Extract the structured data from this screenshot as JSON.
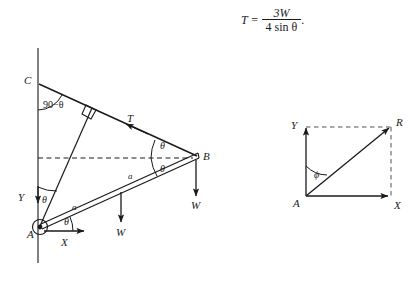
{
  "figure": {
    "equation": {
      "lhs": "T =",
      "numerator": "3W",
      "denominator": "4 sin θ",
      "trailing": "."
    },
    "left_diagram": {
      "name": "beam-free-body-diagram",
      "points": [
        {
          "id": "A",
          "label": "A",
          "x": 40,
          "y": 227
        },
        {
          "id": "B",
          "label": "B",
          "x": 196,
          "y": 157
        },
        {
          "id": "C",
          "label": "C",
          "x": 38,
          "y": 83
        }
      ],
      "axes": [
        {
          "id": "Y",
          "label": "Y",
          "direction": "down"
        },
        {
          "id": "X",
          "label": "X",
          "direction": "right"
        }
      ],
      "angle_labels": [
        {
          "id": "angle-c",
          "label": "90−θ"
        },
        {
          "id": "angle-a-vertical",
          "label": "θ"
        },
        {
          "id": "angle-a-horizontal",
          "label": "θ"
        },
        {
          "id": "angle-b-upper",
          "label": "θ"
        },
        {
          "id": "angle-b-lower",
          "label": "θ"
        }
      ],
      "force_labels": [
        {
          "id": "tension",
          "label": "T"
        },
        {
          "id": "weight-mid",
          "label": "W"
        },
        {
          "id": "weight-end",
          "label": "W"
        }
      ],
      "length_labels": [
        {
          "id": "segment-a-lower",
          "label": "a"
        },
        {
          "id": "segment-a-upper",
          "label": "a"
        }
      ]
    },
    "right_diagram": {
      "name": "resultant-vector-diagram",
      "points": [
        {
          "id": "A",
          "label": "A"
        },
        {
          "id": "R",
          "label": "R"
        }
      ],
      "axes": [
        {
          "id": "Y",
          "label": "Y",
          "direction": "up"
        },
        {
          "id": "X",
          "label": "X",
          "direction": "right"
        }
      ],
      "angle_labels": [
        {
          "id": "angle-phi",
          "label": "ϕ"
        }
      ]
    },
    "colors": {
      "stroke": "#1a1a1a",
      "background": "#ffffff"
    }
  }
}
